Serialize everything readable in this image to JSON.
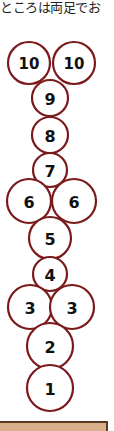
{
  "caption": "ところは両足でお",
  "diagram": {
    "type": "hopscotch",
    "stroke_color": "#7a1a1a",
    "cells": [
      {
        "label": "10",
        "cx": 29,
        "cy": 63,
        "r": 21
      },
      {
        "label": "10",
        "cx": 74,
        "cy": 63,
        "r": 21
      },
      {
        "label": "9",
        "cx": 50,
        "cy": 98,
        "r": 18
      },
      {
        "label": "8",
        "cx": 50,
        "cy": 135,
        "r": 18
      },
      {
        "label": "7",
        "cx": 50,
        "cy": 170,
        "r": 17
      },
      {
        "label": "6",
        "cx": 29,
        "cy": 201,
        "r": 22
      },
      {
        "label": "6",
        "cx": 74,
        "cy": 201,
        "r": 22
      },
      {
        "label": "5",
        "cx": 50,
        "cy": 238,
        "r": 21
      },
      {
        "label": "4",
        "cx": 50,
        "cy": 274,
        "r": 17
      },
      {
        "label": "3",
        "cx": 30,
        "cy": 307,
        "r": 22
      },
      {
        "label": "3",
        "cx": 72,
        "cy": 307,
        "r": 22
      },
      {
        "label": "2",
        "cx": 50,
        "cy": 346,
        "r": 23
      },
      {
        "label": "1",
        "cx": 50,
        "cy": 388,
        "r": 23
      }
    ]
  },
  "footer": {
    "color": "#d9b08a"
  }
}
